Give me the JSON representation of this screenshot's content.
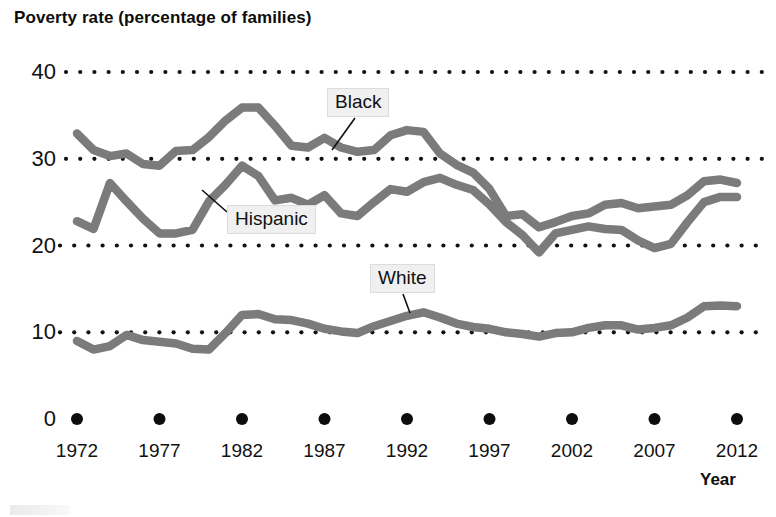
{
  "chart_data": {
    "type": "line",
    "title": "Poverty rate (percentage of families)",
    "xlabel": "Year",
    "ylabel": "",
    "xlim": [
      1972,
      2012
    ],
    "ylim": [
      0,
      40
    ],
    "grid": "dotted-horizontal",
    "legend": "inline-labels",
    "y_ticks": [
      40,
      30,
      20,
      10,
      0
    ],
    "x_ticks": [
      1972,
      1977,
      1982,
      1987,
      1992,
      1997,
      2002,
      2007,
      2012
    ],
    "x": [
      1972,
      1973,
      1974,
      1975,
      1976,
      1977,
      1978,
      1979,
      1980,
      1981,
      1982,
      1983,
      1984,
      1985,
      1986,
      1987,
      1988,
      1989,
      1990,
      1991,
      1992,
      1993,
      1994,
      1995,
      1996,
      1997,
      1998,
      1999,
      2000,
      2001,
      2002,
      2003,
      2004,
      2005,
      2006,
      2007,
      2008,
      2009,
      2010,
      2011,
      2012
    ],
    "series": [
      {
        "name": "Black",
        "color": "#7b7b7b",
        "values": [
          32.9,
          31.0,
          30.3,
          30.6,
          29.4,
          29.2,
          30.9,
          31.0,
          32.5,
          34.4,
          35.9,
          35.9,
          33.8,
          31.5,
          31.3,
          32.4,
          31.3,
          30.8,
          31.0,
          32.7,
          33.3,
          33.1,
          30.6,
          29.3,
          28.4,
          26.5,
          23.4,
          23.6,
          22.1,
          22.7,
          23.4,
          23.7,
          24.7,
          24.9,
          24.3,
          24.5,
          24.7,
          25.8,
          27.4,
          27.6,
          27.2
        ]
      },
      {
        "name": "Hispanic",
        "color": "#7b7b7b",
        "values": [
          22.8,
          21.9,
          27.2,
          25.1,
          23.1,
          21.4,
          21.4,
          21.8,
          25.1,
          27.0,
          29.2,
          28.0,
          25.2,
          25.5,
          24.7,
          25.8,
          23.7,
          23.4,
          25.0,
          26.5,
          26.2,
          27.3,
          27.8,
          27.0,
          26.4,
          24.7,
          22.7,
          21.2,
          19.2,
          21.4,
          21.8,
          22.2,
          21.9,
          21.8,
          20.6,
          19.7,
          20.2,
          22.7,
          25.0,
          25.6,
          25.6
        ]
      },
      {
        "name": "White",
        "color": "#7b7b7b",
        "values": [
          9.0,
          8.0,
          8.4,
          9.7,
          9.1,
          8.9,
          8.7,
          8.1,
          8.0,
          9.9,
          12.0,
          12.1,
          11.5,
          11.4,
          11.0,
          10.4,
          10.1,
          9.9,
          10.7,
          11.3,
          11.9,
          12.3,
          11.7,
          11.0,
          10.6,
          10.4,
          10.0,
          9.8,
          9.5,
          9.9,
          10.0,
          10.5,
          10.8,
          10.8,
          10.3,
          10.5,
          10.8,
          11.7,
          13.0,
          13.1,
          13.0
        ]
      }
    ],
    "annotations": [
      {
        "label": "Black",
        "x_pct": 42.2,
        "y_px": 88
      },
      {
        "label": "Hispanic",
        "x_pct": 29.3,
        "y_px": 205
      },
      {
        "label": "White",
        "x_pct": 47.7,
        "y_px": 264
      }
    ]
  },
  "axis": {
    "y_tick_labels": [
      "40",
      "30",
      "20",
      "10",
      "0"
    ],
    "x_tick_labels": [
      "1972",
      "1977",
      "1982",
      "1987",
      "1992",
      "1997",
      "2002",
      "2007",
      "2012"
    ],
    "x_axis_title": "Year"
  },
  "labels": {
    "black": "Black",
    "hispanic": "Hispanic",
    "white": "White"
  }
}
